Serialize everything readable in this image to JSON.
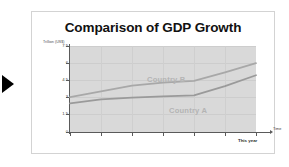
{
  "slide": {
    "title": "Comparison of GDP Growth"
  },
  "navigation": {
    "advance_arrow_icon": "play-arrow-icon"
  },
  "chart_data": {
    "type": "line",
    "title": "Comparison of GDP Growth",
    "ylabel": "Trillion (US$)",
    "xlabel": "Time",
    "x_end_label": "This year",
    "ylim": [
      0,
      7.5
    ],
    "yticks": [
      "0",
      "1.5",
      "3",
      "4.5",
      "6",
      "7.5"
    ],
    "ytick_values": [
      0,
      1.5,
      3,
      4.5,
      6,
      7.5
    ],
    "x_tick_count": 7,
    "grid": true,
    "legend_position": "inline-labels",
    "categories": [
      0,
      1,
      2,
      3,
      4,
      5,
      6
    ],
    "series": [
      {
        "name": "Country B",
        "color": "#a8a8a8",
        "values": [
          3.05,
          3.55,
          4.05,
          4.3,
          4.45,
          5.2,
          6.0
        ]
      },
      {
        "name": "Country A",
        "color": "#9a9a9a",
        "values": [
          2.5,
          2.85,
          3.0,
          3.1,
          3.2,
          4.0,
          4.95
        ]
      }
    ]
  },
  "colors": {
    "plot_background": "#d9d9d9",
    "card_background": "#ffffff",
    "axis": "#5a5a5a",
    "series_label": "#b4b4b4",
    "title_text": "#111111",
    "arrow": "#000000"
  }
}
